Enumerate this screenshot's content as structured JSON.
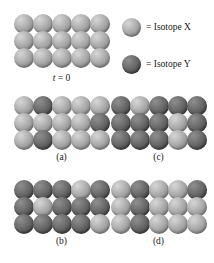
{
  "figure": {
    "legend": {
      "items": [
        {
          "icon": "sphere-light-icon",
          "type": "x",
          "label": "= Isotope X"
        },
        {
          "icon": "sphere-dark-icon",
          "type": "y",
          "label": "= Isotope Y"
        }
      ]
    },
    "colors": {
      "isotope_x_light": "#d6d6d6",
      "isotope_x_mid": "#a3a3a3",
      "isotope_x_dark": "#6e6e6e",
      "isotope_y_light": "#8e8e8e",
      "isotope_y_mid": "#616161",
      "isotope_y_dark": "#383838",
      "background": "#ffffff",
      "text": "#1a1a1a"
    },
    "panels": [
      {
        "id": "t0",
        "caption_italic": "t",
        "caption_eq": " = ",
        "caption_num": "0",
        "caption": "t = 0",
        "rows": 3,
        "cols": 5,
        "grid": [
          [
            "x",
            "x",
            "x",
            "x",
            "x"
          ],
          [
            "x",
            "x",
            "x",
            "x",
            "x"
          ],
          [
            "x",
            "x",
            "x",
            "x",
            "x"
          ]
        ]
      },
      {
        "id": "a",
        "caption": "(a)",
        "rows": 3,
        "cols": 5,
        "grid": [
          [
            "x",
            "y",
            "x",
            "x",
            "x"
          ],
          [
            "x",
            "x",
            "x",
            "x",
            "y"
          ],
          [
            "x",
            "y",
            "x",
            "x",
            "x"
          ]
        ]
      },
      {
        "id": "c",
        "caption": "(c)",
        "rows": 3,
        "cols": 5,
        "grid": [
          [
            "y",
            "x",
            "y",
            "y",
            "y"
          ],
          [
            "y",
            "y",
            "y",
            "x",
            "y"
          ],
          [
            "y",
            "y",
            "y",
            "x",
            "y"
          ]
        ]
      },
      {
        "id": "b",
        "caption": "(b)",
        "rows": 3,
        "cols": 5,
        "grid": [
          [
            "y",
            "y",
            "y",
            "x",
            "y"
          ],
          [
            "y",
            "x",
            "y",
            "y",
            "y"
          ],
          [
            "y",
            "y",
            "y",
            "y",
            "x"
          ]
        ]
      },
      {
        "id": "d",
        "caption": "(d)",
        "rows": 3,
        "cols": 5,
        "grid": [
          [
            "x",
            "y",
            "x",
            "x",
            "y"
          ],
          [
            "x",
            "y",
            "x",
            "x",
            "x"
          ],
          [
            "x",
            "y",
            "x",
            "x",
            "x"
          ]
        ]
      }
    ]
  }
}
